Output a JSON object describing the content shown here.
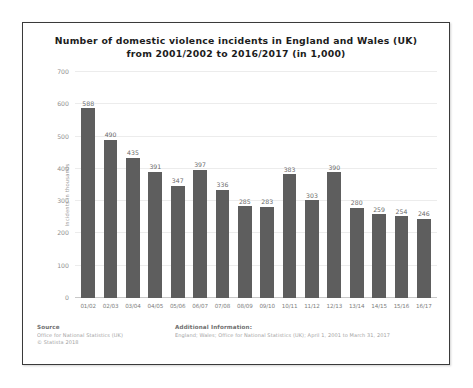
{
  "chart_data": {
    "type": "bar",
    "title": "Number of domestic violence incidents in England and Wales (UK) from 2001/2002 to 2016/2017 (in 1,000)",
    "title_line1": "Number of domestic violence incidents in England and Wales (UK)",
    "title_line2": "from 2001/2002 to 2016/2017 (in 1,000)",
    "xlabel": "",
    "ylabel": "Incidents in thousands",
    "ylim": [
      0,
      700
    ],
    "yticks": [
      0,
      100,
      200,
      300,
      400,
      500,
      600,
      700
    ],
    "grid": true,
    "legend": "none",
    "bar_color": "#5e5e5e",
    "categories": [
      "01/02",
      "02/03",
      "03/04",
      "04/05",
      "05/06",
      "06/07",
      "07/08",
      "08/09",
      "09/10",
      "10/11",
      "11/12",
      "12/13",
      "13/14",
      "14/15",
      "15/16",
      "16/17"
    ],
    "values": [
      588,
      490,
      435,
      391,
      347,
      397,
      336,
      285,
      283,
      383,
      303,
      390,
      280,
      259,
      254,
      246
    ]
  },
  "footer": {
    "source_heading": "Source",
    "source_line1": "Office for National Statistics (UK)",
    "source_line2": "© Statista 2018",
    "additional_heading": "Additional Information:",
    "additional_line1": "England; Wales; Office for National Statistics (UK); April 1, 2001 to March 31, 2017"
  }
}
